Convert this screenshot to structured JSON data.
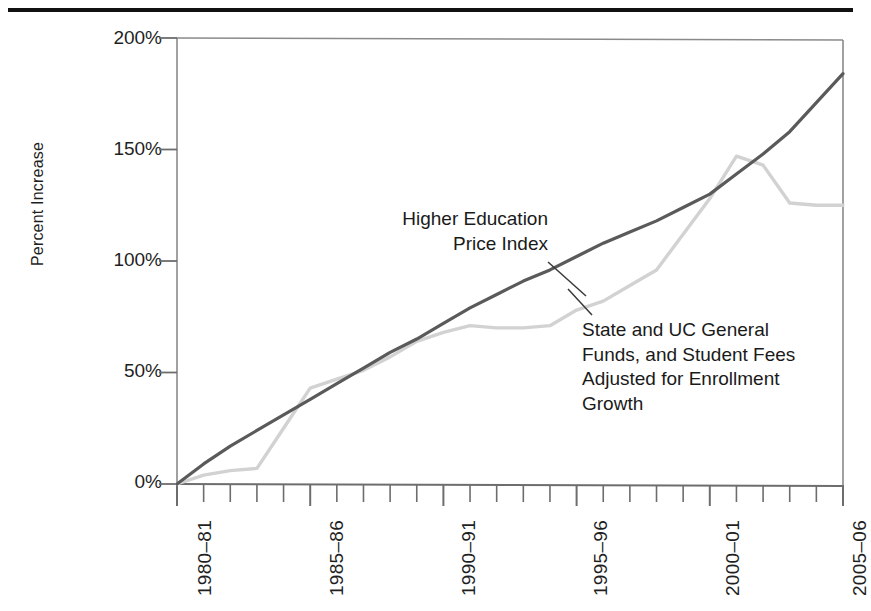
{
  "figure": {
    "name": "higher-education-cost-chart",
    "top_rule": true
  },
  "axes": {
    "ylabel": "Percent Increase",
    "yticks": [
      "0%",
      "50%",
      "100%",
      "150%",
      "200%"
    ],
    "ytick_values": [
      0,
      50,
      100,
      150,
      200
    ],
    "ylim": [
      0,
      200
    ],
    "xticks": [
      "1980–81",
      "1985–86",
      "1990–91",
      "1995–96",
      "2000–01",
      "2005–06"
    ],
    "xtick_values": [
      0,
      5,
      10,
      15,
      20,
      25
    ],
    "xlim": [
      0,
      25
    ],
    "xlabel": "",
    "grid": false,
    "minor_ticks_per_major": 5
  },
  "annotations": {
    "hepi": {
      "text": "Higher Education\nPrice Index",
      "leader_from": [
        548,
        262
      ],
      "leader_to": [
        586,
        296
      ]
    },
    "state": {
      "text": "State and UC General\nFunds, and Student Fees\nAdjusted for Enrollment\nGrowth",
      "leader_from": [
        592,
        315
      ],
      "leader_to": [
        568,
        289
      ]
    }
  },
  "colors": {
    "hepi_line": "#5a5a5a",
    "state_line": "#d2d2d2",
    "axis": "#707070",
    "text": "#1a1a1a",
    "rule": "#111111",
    "background": "#ffffff"
  },
  "chart_data": {
    "type": "line",
    "title": "",
    "xlabel": "",
    "ylabel": "Percent Increase",
    "xlim": [
      0,
      25
    ],
    "ylim": [
      0,
      200
    ],
    "grid": false,
    "legend_position": "inline-annotations",
    "x": [
      "1980–81",
      "1981–82",
      "1982–83",
      "1983–84",
      "1984–85",
      "1985–86",
      "1986–87",
      "1987–88",
      "1988–89",
      "1989–90",
      "1990–91",
      "1991–92",
      "1992–93",
      "1993–94",
      "1994–95",
      "1995–96",
      "1996–97",
      "1997–98",
      "1998–99",
      "1999–00",
      "2000–01",
      "2001–02",
      "2002–03",
      "2003–04",
      "2004–05",
      "2005–06"
    ],
    "x_index": [
      0,
      1,
      2,
      3,
      4,
      5,
      6,
      7,
      8,
      9,
      10,
      11,
      12,
      13,
      14,
      15,
      16,
      17,
      18,
      19,
      20,
      21,
      22,
      23,
      24,
      25
    ],
    "series": [
      {
        "name": "Higher Education Price Index",
        "color": "#5a5a5a",
        "values": [
          0,
          9,
          17,
          24,
          31,
          38,
          45,
          52,
          59,
          65,
          72,
          79,
          85,
          91,
          96,
          102,
          108,
          113,
          118,
          124,
          130,
          139,
          148,
          158,
          171,
          184
        ]
      },
      {
        "name": "State and UC General Funds, and Student Fees Adjusted for Enrollment Growth",
        "color": "#d2d2d2",
        "values": [
          0,
          4,
          6,
          7,
          25,
          43,
          47,
          51,
          57,
          64,
          68,
          71,
          70,
          70,
          71,
          78,
          82,
          89,
          96,
          112,
          128,
          147,
          143,
          126,
          125,
          125
        ]
      }
    ]
  }
}
